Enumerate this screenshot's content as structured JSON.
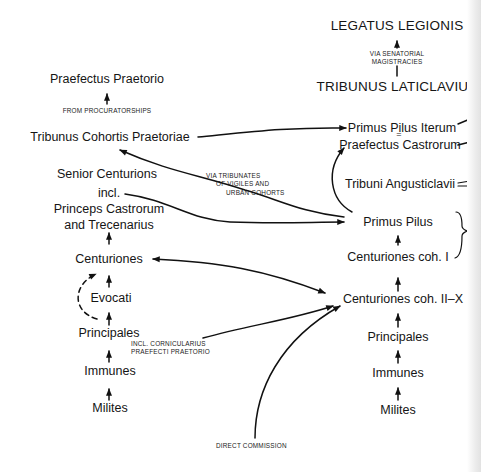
{
  "diagram": {
    "type": "career-progression-flowchart",
    "left_column": {
      "nodes": [
        {
          "id": "praefectus_praetorio",
          "label": "Praefectus Praetorio"
        },
        {
          "id": "tribunus_cohortis_praetoriae",
          "label": "Tribunus Cohortis Praetoriae"
        },
        {
          "id": "senior_centurions",
          "label": "Senior Centurions"
        },
        {
          "id": "incl",
          "label": "incl."
        },
        {
          "id": "princeps_castrorum",
          "label": "Princeps Castrorum"
        },
        {
          "id": "and_trecenarius",
          "label": "and Trecenarius"
        },
        {
          "id": "centuriones",
          "label": "Centuriones"
        },
        {
          "id": "evocati",
          "label": "Evocati"
        },
        {
          "id": "principales",
          "label": "Principales"
        },
        {
          "id": "immunes",
          "label": "Immunes"
        },
        {
          "id": "milites",
          "label": "Milites"
        }
      ]
    },
    "right_column": {
      "nodes": [
        {
          "id": "legatus_legionis",
          "label": "LEGATUS LEGIONIS"
        },
        {
          "id": "tribunus_laticlavius",
          "label": "TRIBUNUS LATICLAVIUS"
        },
        {
          "id": "primus_pilus_iterum",
          "label": "Primus Pilus Iterum"
        },
        {
          "id": "equals",
          "label": "="
        },
        {
          "id": "praefectus_castrorum",
          "label": "Praefectus Castrorum"
        },
        {
          "id": "tribuni_angusticlavii",
          "label": "Tribuni Angusticlavii"
        },
        {
          "id": "primus_pilus",
          "label": "Primus Pilus"
        },
        {
          "id": "centuriones_coh_i",
          "label": "Centuriones coh. I"
        },
        {
          "id": "centuriones_coh_ii_x",
          "label": "Centuriones coh. II–X"
        },
        {
          "id": "principales_r",
          "label": "Principales"
        },
        {
          "id": "immunes_r",
          "label": "Immunes"
        },
        {
          "id": "milites_r",
          "label": "Milites"
        }
      ]
    },
    "annotations": {
      "via_senatorial_1": "VIA SENATORIAL",
      "via_senatorial_2": "MAGISTRACIES",
      "from_procuratorships": "FROM PROCURATORSHIPS",
      "via_tribunates_1": "VIA TRIBUNATES",
      "via_tribunates_2": "OF VIGILES AND",
      "via_tribunates_3": "URBAN COHORTS",
      "incl_cornicularius_1": "INCL. CORNICULARIUS",
      "incl_cornicularius_2": "PRAEFECTI PRAETORIO",
      "direct_commission": "DIRECT COMMISSION",
      "brace_fragment_1": "P",
      "brace_fragment_2": "O"
    },
    "edges": [
      {
        "from": "tribunus_laticlavius",
        "to": "legatus_legionis",
        "via": "VIA SENATORIAL MAGISTRACIES"
      },
      {
        "from": "tribunus_cohortis_praetoriae",
        "to": "praefectus_praetorio",
        "via": "FROM PROCURATORSHIPS"
      },
      {
        "from": "tribunus_cohortis_praetoriae",
        "to": "primus_pilus_iterum"
      },
      {
        "from": "primus_pilus",
        "to": "tribunus_cohortis_praetoriae",
        "via": "VIA TRIBUNATES OF VIGILES AND URBAN COHORTS"
      },
      {
        "from": "senior_centurions",
        "to": "primus_pilus"
      },
      {
        "from": "primus_pilus",
        "to": "praefectus_castrorum"
      },
      {
        "from": "centuriones_coh_ii_x",
        "to": "centuriones",
        "bidirectional": true
      },
      {
        "from": "principales",
        "to": "centuriones_coh_ii_x",
        "via": "INCL. CORNICULARIUS PRAEFECTI PRAETORIO"
      },
      {
        "from": "direct_commission",
        "to": "centuriones_coh_ii_x"
      },
      {
        "from": "principales",
        "to": "centuriones",
        "style": "dashed"
      },
      {
        "from": "centuriones",
        "to": "and_trecenarius"
      },
      {
        "from": "evocati",
        "to": "centuriones"
      },
      {
        "from": "principales",
        "to": "evocati"
      },
      {
        "from": "immunes",
        "to": "principales"
      },
      {
        "from": "milites",
        "to": "immunes"
      },
      {
        "from": "centuriones_coh_i",
        "to": "primus_pilus"
      },
      {
        "from": "centuriones_coh_ii_x",
        "to": "centuriones_coh_i"
      },
      {
        "from": "principales_r",
        "to": "centuriones_coh_ii_x"
      },
      {
        "from": "immunes_r",
        "to": "principales_r"
      },
      {
        "from": "milites_r",
        "to": "immunes_r"
      }
    ]
  }
}
